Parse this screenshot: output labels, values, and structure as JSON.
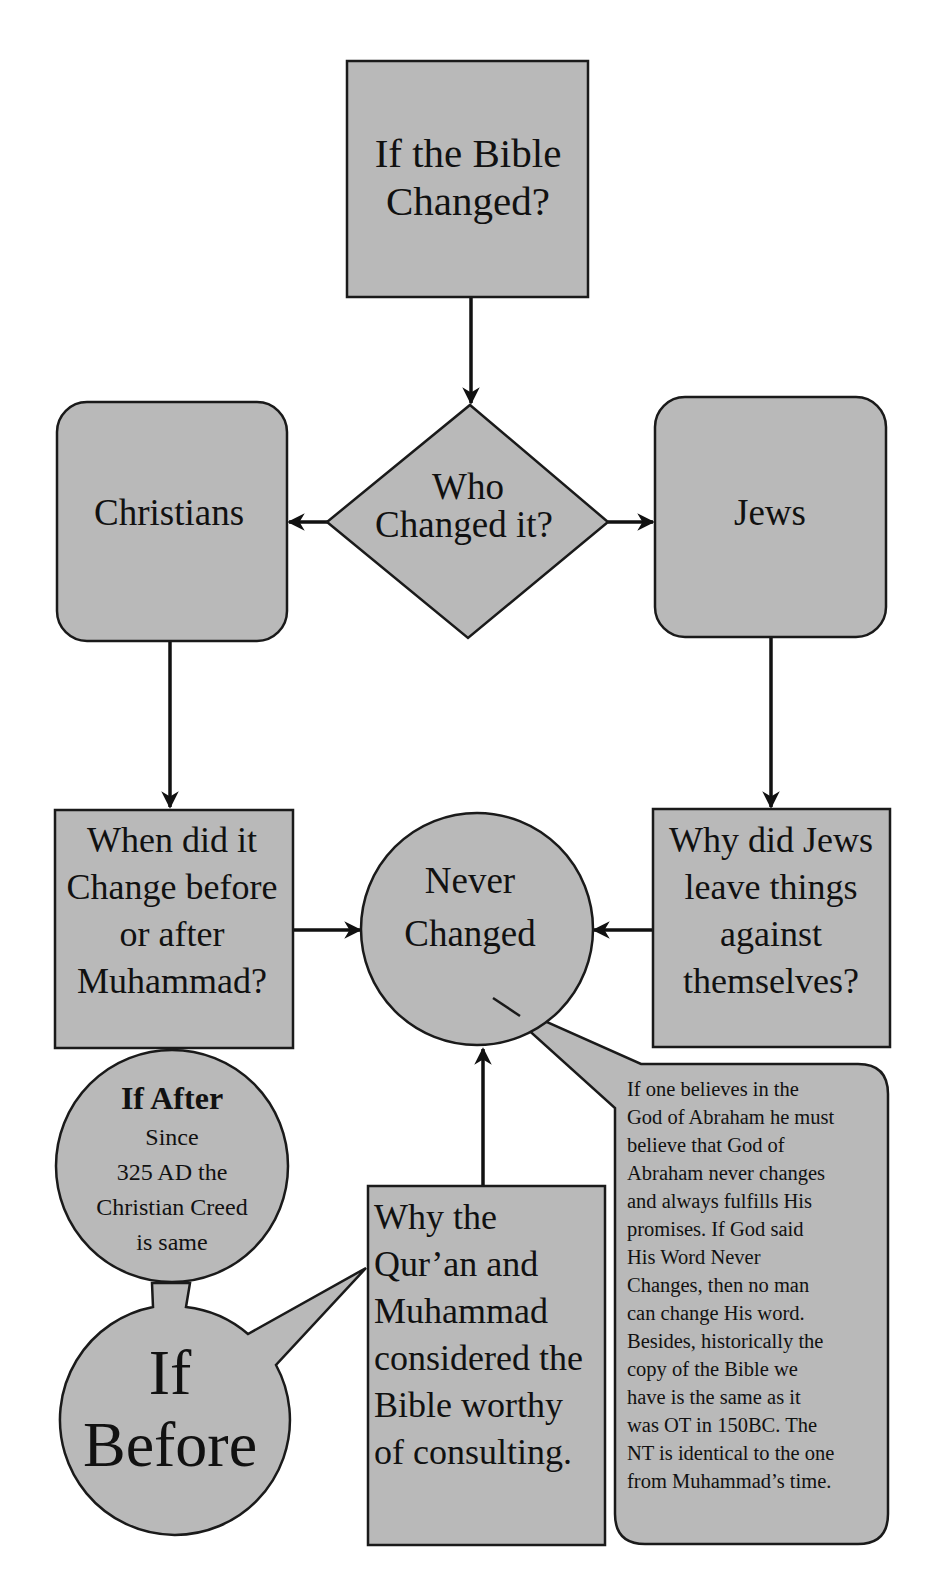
{
  "diagram": {
    "type": "flowchart",
    "fill_color": "#b9b9b9",
    "stroke_color": "#1a1a1a",
    "nodes": {
      "start": {
        "shape": "rectangle",
        "lines": [
          "If the Bible",
          "Changed?"
        ]
      },
      "decision": {
        "shape": "diamond",
        "lines": [
          "Who",
          "Changed it?"
        ]
      },
      "christians": {
        "shape": "rounded-rectangle",
        "lines": [
          "Christians"
        ]
      },
      "jews": {
        "shape": "rounded-rectangle",
        "lines": [
          "Jews"
        ]
      },
      "when_changed": {
        "shape": "rectangle",
        "lines": [
          "When did it",
          "Change before",
          "or after",
          "Muhammad?"
        ]
      },
      "never_changed": {
        "shape": "circle",
        "lines": [
          "Never",
          "Changed"
        ]
      },
      "why_jews": {
        "shape": "rectangle",
        "lines": [
          "Why did Jews",
          "leave things",
          "against",
          "themselves?"
        ]
      },
      "if_after": {
        "shape": "circle",
        "title": "If After",
        "lines": [
          "Since",
          "325 AD the",
          "Christian Creed",
          "is same"
        ]
      },
      "if_before": {
        "shape": "callout-circle",
        "lines": [
          "If",
          "Before"
        ]
      },
      "why_quran": {
        "shape": "rectangle",
        "lines": [
          "Why the",
          "Qur’an and",
          "Muhammad",
          "considered the",
          "Bible worthy",
          "of consulting."
        ]
      },
      "note": {
        "shape": "callout-rounded-rectangle",
        "lines": [
          "If one believes in the",
          "God of Abraham he must",
          "believe that God  of",
          "Abraham never changes",
          "and always fulfills His",
          "promises. If God said",
          "His Word Never",
          "Changes, then no man",
          "can change His word.",
          "Besides, historically the",
          "copy of the Bible we",
          "have is the same as it",
          "was OT in 150BC. The",
          "NT is identical to the one",
          "from Muhammad’s time."
        ]
      }
    },
    "edges": [
      {
        "from": "start",
        "to": "decision"
      },
      {
        "from": "decision",
        "to": "christians"
      },
      {
        "from": "decision",
        "to": "jews"
      },
      {
        "from": "christians",
        "to": "when_changed"
      },
      {
        "from": "jews",
        "to": "why_jews"
      },
      {
        "from": "when_changed",
        "to": "never_changed"
      },
      {
        "from": "why_jews",
        "to": "never_changed"
      },
      {
        "from": "why_quran",
        "to": "never_changed"
      }
    ]
  }
}
